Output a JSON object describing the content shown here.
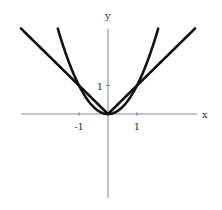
{
  "chart_data": {
    "type": "line",
    "title": "",
    "xlabel": "x",
    "ylabel": "y",
    "xlim": [
      -3,
      3
    ],
    "ylim": [
      -2.9,
      2.9
    ],
    "grid": false,
    "legend": null,
    "x_ticks": [
      {
        "value": -1,
        "label": "-1"
      },
      {
        "value": 1,
        "label": "1"
      }
    ],
    "y_ticks": [
      {
        "value": 1,
        "label": "1"
      }
    ],
    "series": [
      {
        "name": "y = |x|",
        "domain": [
          -3,
          3
        ],
        "x": [
          -3,
          -2,
          -1,
          0,
          1,
          2,
          3
        ],
        "values": [
          3,
          2,
          1,
          0,
          1,
          2,
          3
        ],
        "color": "#111111"
      },
      {
        "name": "y = x^2",
        "domain": [
          -1.73,
          1.73
        ],
        "x": [
          -1.73,
          -1.5,
          -1,
          -0.5,
          0,
          0.5,
          1,
          1.5,
          1.73
        ],
        "values": [
          2.99,
          2.25,
          1,
          0.25,
          0,
          0.25,
          1,
          2.25,
          2.99
        ],
        "color": "#111111"
      }
    ],
    "annotations": [
      "intersections at (-1,1), (0,0), (1,1)"
    ]
  },
  "layout": {
    "origin_px": [
      108,
      114
    ],
    "x_scale_px": 29,
    "y_scale_px": 28.5,
    "x_axis_px": [
      21,
      197
    ],
    "y_axis_px": [
      29,
      198
    ]
  }
}
